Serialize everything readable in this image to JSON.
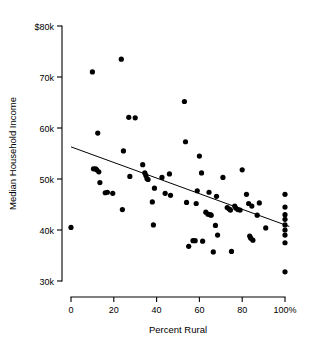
{
  "chart_data": {
    "type": "scatter",
    "title": "",
    "xlabel": "Percent Rural",
    "ylabel": "Median Household Income",
    "xlim": [
      0,
      100
    ],
    "ylim": [
      30000,
      80000
    ],
    "grid": false,
    "legend": null,
    "x_ticks": [
      {
        "value": 0,
        "label": "0"
      },
      {
        "value": 20,
        "label": "20"
      },
      {
        "value": 40,
        "label": "40"
      },
      {
        "value": 60,
        "label": "60"
      },
      {
        "value": 80,
        "label": "80"
      },
      {
        "value": 100,
        "label": "100%"
      }
    ],
    "y_ticks": [
      {
        "value": 80000,
        "label": "$80k"
      },
      {
        "value": 70000,
        "label": "70k"
      },
      {
        "value": 60000,
        "label": "60k"
      },
      {
        "value": 50000,
        "label": "50k"
      },
      {
        "value": 40000,
        "label": "40k"
      },
      {
        "value": 30000,
        "label": "30k"
      }
    ],
    "series": [
      {
        "name": "States",
        "marker": "filled-circle",
        "color": "#000000",
        "points": [
          [
            0,
            40500
          ],
          [
            10,
            71000
          ],
          [
            10.5,
            52000
          ],
          [
            11.5,
            52000
          ],
          [
            12,
            51800
          ],
          [
            12.5,
            59000
          ],
          [
            13,
            51400
          ],
          [
            13.5,
            49300
          ],
          [
            16,
            47300
          ],
          [
            17,
            47400
          ],
          [
            19.5,
            47200
          ],
          [
            23.5,
            73500
          ],
          [
            24,
            44000
          ],
          [
            24.5,
            55500
          ],
          [
            27,
            62100
          ],
          [
            27.5,
            50500
          ],
          [
            30,
            62000
          ],
          [
            33.5,
            52800
          ],
          [
            34.5,
            51200
          ],
          [
            35,
            50700
          ],
          [
            35.5,
            50100
          ],
          [
            36,
            49900
          ],
          [
            38,
            45500
          ],
          [
            38.5,
            41000
          ],
          [
            39,
            48200
          ],
          [
            42.5,
            50300
          ],
          [
            44,
            47200
          ],
          [
            46,
            51000
          ],
          [
            46.5,
            46800
          ],
          [
            53,
            65200
          ],
          [
            53.5,
            57300
          ],
          [
            54,
            45400
          ],
          [
            55,
            36800
          ],
          [
            57,
            37900
          ],
          [
            58,
            37900
          ],
          [
            58.5,
            45200
          ],
          [
            59,
            47700
          ],
          [
            60,
            54500
          ],
          [
            61,
            51200
          ],
          [
            61.5,
            37800
          ],
          [
            63,
            43500
          ],
          [
            64,
            43100
          ],
          [
            64.5,
            47400
          ],
          [
            65,
            43000
          ],
          [
            65.5,
            42900
          ],
          [
            66.5,
            35700
          ],
          [
            67.5,
            40900
          ],
          [
            68,
            46600
          ],
          [
            68.5,
            39000
          ],
          [
            71,
            50300
          ],
          [
            73,
            44400
          ],
          [
            74,
            44100
          ],
          [
            74.5,
            43900
          ],
          [
            75,
            35800
          ],
          [
            76.5,
            44700
          ],
          [
            77,
            44300
          ],
          [
            78,
            44000
          ],
          [
            79,
            43900
          ],
          [
            80,
            51800
          ],
          [
            82,
            47000
          ],
          [
            83,
            45200
          ],
          [
            83.5,
            38800
          ],
          [
            84,
            38400
          ],
          [
            84.5,
            44700
          ],
          [
            85,
            38000
          ],
          [
            87,
            42900
          ],
          [
            88,
            45300
          ],
          [
            91,
            40400
          ],
          [
            100,
            47000
          ],
          [
            100,
            44500
          ],
          [
            100,
            43000
          ],
          [
            100,
            42100
          ],
          [
            100,
            41000
          ],
          [
            100,
            40000
          ],
          [
            100,
            39000
          ],
          [
            100,
            37500
          ],
          [
            100,
            31800
          ]
        ]
      }
    ],
    "trend_line": {
      "name": "Linear fit",
      "x_start": 0,
      "y_start": 56300,
      "x_end": 102,
      "y_end": 40700
    }
  }
}
